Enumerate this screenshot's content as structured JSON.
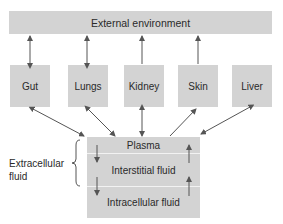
{
  "diagram": {
    "external": "External environment",
    "organs": [
      {
        "label": "Gut",
        "to_external": "bidirectional",
        "to_plasma": "bidirectional"
      },
      {
        "label": "Lungs",
        "to_external": "bidirectional",
        "to_plasma": "bidirectional"
      },
      {
        "label": "Kidney",
        "to_external": "to-external",
        "to_plasma": "bidirectional"
      },
      {
        "label": "Skin",
        "to_external": "to-external",
        "to_plasma": "to-organ"
      },
      {
        "label": "Liver",
        "to_external": "none",
        "to_plasma": "bidirectional"
      }
    ],
    "compartments": {
      "plasma": "Plasma",
      "interstitial": "Interstitial fluid",
      "intracellular": "Intracellular fluid"
    },
    "extracellular_label_line1": "Extracellular",
    "extracellular_label_line2": "fluid"
  },
  "colors": {
    "box": "#d3d3d3",
    "arrow": "#555555",
    "text": "#2a2a2a"
  }
}
